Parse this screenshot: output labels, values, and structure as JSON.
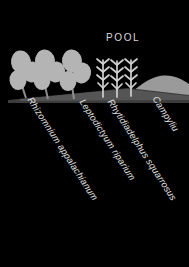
{
  "figure": {
    "background_color": "#000000",
    "ground_color": "#4a4a4a",
    "mound_color": "#9a9a9a",
    "plant_color": "#b4b4b4",
    "stem_color": "#cfcfcf",
    "text_color": "#e2e2e2"
  },
  "annotations": {
    "pool_label": "POOL"
  },
  "species": [
    {
      "name": "Rhizomnium appalachianum",
      "leader_x": 33,
      "leader_y": 96,
      "angle": 57,
      "form": "round-leaved-moss"
    },
    {
      "name": "Leptodictyum riparium",
      "leader_x": 85,
      "leader_y": 98,
      "angle": 57,
      "form": "feather-moss"
    },
    {
      "name": "Rhytidiadelphus squarrosus",
      "leader_x": 113,
      "leader_y": 98,
      "angle": 57,
      "form": "feather-moss"
    },
    {
      "name": "Campyliu",
      "leader_x": 158,
      "leader_y": 95,
      "angle": 57,
      "form": "mound-moss",
      "truncated": true
    }
  ],
  "plants": {
    "round_leaved_clump": {
      "count": 4,
      "label_ref": "Rhizomnium appalachianum"
    },
    "upright_feathery": {
      "count": 3,
      "label_ref": "Leptodictyum riparium"
    }
  }
}
